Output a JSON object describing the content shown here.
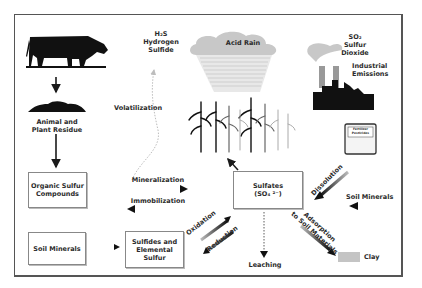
{
  "diagram": {
    "nodes": {
      "h2s": {
        "formula": "H₂S",
        "line1": "Hydrogen",
        "line2": "Sulfide"
      },
      "acid_rain": "Acid Rain",
      "so2": {
        "formula": "SO₂",
        "line1": "Sulfur",
        "line2": "Dioxide"
      },
      "industrial": {
        "line1": "Industrial",
        "line2": "Emissions"
      },
      "residue": {
        "line1": "Animal and",
        "line2": "Plant Residue"
      },
      "volatilization": "Volatilization",
      "fertilizer": {
        "line1": "Fertilizer",
        "line2": "Pesticides"
      },
      "organic_box": {
        "line1": "Organic Sulfur",
        "line2": "Compounds"
      },
      "mineralization": "Mineralization",
      "immobilization": "Immobilization",
      "sulfates_box": {
        "line1": "Sulfates",
        "line2": "(SO₄ ²⁻)"
      },
      "dissolution": "Dissolution",
      "soil_minerals_right": "Soil Minerals",
      "soil_minerals_box": "Soil Minerals",
      "sulfides_box": {
        "line1": "Sulfides and",
        "line2": "Elemental",
        "line3": "Sulfur"
      },
      "oxidation": "Oxidation",
      "reduction": "Reduction",
      "leaching": "Leaching",
      "adsorption": {
        "line1": "Adsorption",
        "line2": "to Soil Materials"
      },
      "clay": "Clay"
    },
    "colors": {
      "ink": "#1a1a1a",
      "cloud": "#c8c8c8",
      "clay": "#c4c4c4",
      "border": "#555555"
    }
  }
}
